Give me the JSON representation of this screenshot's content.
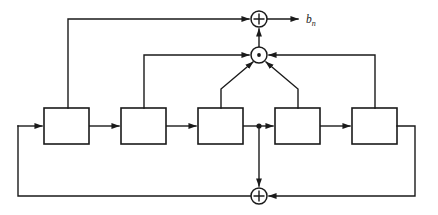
{
  "diagram": {
    "type": "block-diagram",
    "canvas": {
      "width": 438,
      "height": 215,
      "background": "#ffffff"
    },
    "line_color": "#1a1a1a",
    "output_label": "b",
    "output_label_subscript": "n",
    "registers": [
      {
        "id": "stage-1",
        "label": "",
        "x": 44,
        "y": 108,
        "width": 45,
        "height": 36
      },
      {
        "id": "stage-2",
        "label": "",
        "x": 121,
        "y": 108,
        "width": 45,
        "height": 36
      },
      {
        "id": "stage-3",
        "label": "",
        "x": 198,
        "y": 108,
        "width": 45,
        "height": 36
      },
      {
        "id": "stage-4",
        "label": "",
        "x": 275,
        "y": 108,
        "width": 45,
        "height": 36
      },
      {
        "id": "stage-5",
        "label": "",
        "x": 352,
        "y": 108,
        "width": 45,
        "height": 36
      }
    ],
    "nodes": [
      {
        "id": "top-adder",
        "glyph": "+",
        "cx": 259,
        "cy": 19,
        "r": 8
      },
      {
        "id": "mid-sum-node",
        "glyph": "dot",
        "cx": 259,
        "cy": 55,
        "r": 8
      },
      {
        "id": "bottom-adder",
        "glyph": "+",
        "cx": 259,
        "cy": 196,
        "r": 8
      }
    ],
    "junctions": [
      {
        "id": "tap-junction",
        "cx": 259,
        "cy": 126
      }
    ]
  }
}
